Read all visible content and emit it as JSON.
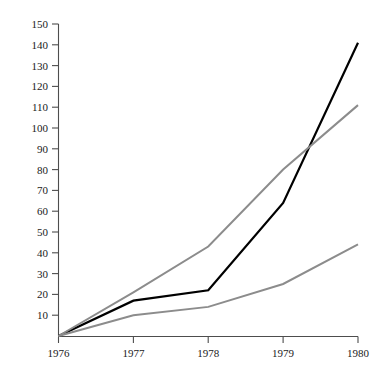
{
  "chart_data": {
    "type": "line",
    "title": "",
    "subtitle": "",
    "xlabel": "",
    "ylabel": "",
    "x": [
      "1976",
      "1977",
      "1978",
      "1979",
      "1980"
    ],
    "categories": [
      "1976",
      "1977",
      "1978",
      "1979",
      "1980"
    ],
    "xlim": [
      1976,
      1980
    ],
    "ylim": [
      0,
      150
    ],
    "grid": false,
    "legend": "none",
    "y_ticks": [
      0,
      10,
      20,
      30,
      40,
      50,
      60,
      70,
      80,
      90,
      100,
      110,
      120,
      130,
      140,
      150
    ],
    "y_tick_labels": [
      "",
      "10",
      "20",
      "30",
      "40",
      "50",
      "60",
      "70",
      "80",
      "90",
      "100",
      "110",
      "120",
      "130",
      "140",
      "150"
    ],
    "x_ticks": [
      "1976",
      "1977",
      "1978",
      "1979",
      "1980"
    ],
    "series": [
      {
        "name": "series-black",
        "color": "#000000",
        "width": 2.2,
        "values": [
          0,
          17,
          22,
          64,
          141
        ]
      },
      {
        "name": "series-gray-upper",
        "color": "#8c8c8c",
        "width": 2.0,
        "values": [
          0,
          21,
          43,
          80,
          111
        ]
      },
      {
        "name": "series-gray-lower",
        "color": "#8c8c8c",
        "width": 2.0,
        "values": [
          0,
          10,
          14,
          25,
          44
        ]
      }
    ]
  },
  "axes": {
    "y_axis_label_0": "",
    "y_axis_label_10": "10",
    "y_axis_label_20": "20",
    "y_axis_label_30": "30",
    "y_axis_label_40": "40",
    "y_axis_label_50": "50",
    "y_axis_label_60": "60",
    "y_axis_label_70": "70",
    "y_axis_label_80": "80",
    "y_axis_label_90": "90",
    "y_axis_label_100": "100",
    "y_axis_label_110": "110",
    "y_axis_label_120": "120",
    "y_axis_label_130": "130",
    "y_axis_label_140": "140",
    "y_axis_label_150": "150",
    "x_axis_label_1976": "1976",
    "x_axis_label_1977": "1977",
    "x_axis_label_1978": "1978",
    "x_axis_label_1979": "1979",
    "x_axis_label_1980": "1980"
  },
  "colors": {
    "background": "#ffffff",
    "axis": "#4d4d4d",
    "text": "#1a1a1a",
    "series_black": "#000000",
    "series_gray": "#8c8c8c"
  }
}
